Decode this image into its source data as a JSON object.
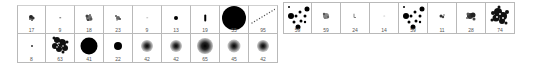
{
  "brush_grid": {
    "row1": [
      {
        "size": "17",
        "type": "scatter"
      },
      {
        "size": "9",
        "type": "dot-small"
      },
      {
        "size": "18",
        "type": "scatter"
      },
      {
        "size": "23",
        "type": "scatter"
      },
      {
        "size": "9",
        "type": "dot-small"
      },
      {
        "size": "13",
        "type": "dot-hard"
      },
      {
        "size": "19",
        "type": "bar-vertical"
      },
      {
        "size": "55",
        "type": "dot-hard-large"
      },
      {
        "size": "95",
        "type": "dotted-line"
      }
    ],
    "row2": [
      {
        "size": "8",
        "type": "dot-small"
      },
      {
        "size": "63",
        "type": "scatter-large"
      },
      {
        "size": "41",
        "type": "dot-hard-large"
      },
      {
        "size": "22",
        "type": "dot-hard"
      },
      {
        "size": "42",
        "type": "soft-round"
      },
      {
        "size": "42",
        "type": "soft-round"
      },
      {
        "size": "65",
        "type": "soft-round"
      },
      {
        "size": "45",
        "type": "soft-round"
      },
      {
        "size": "42",
        "type": "soft-round"
      }
    ]
  },
  "brush_strip": [
    {
      "size": "59",
      "type": "dot-cluster"
    },
    {
      "size": "59",
      "type": "scatter"
    },
    {
      "size": "24",
      "type": "glyph"
    },
    {
      "size": "14",
      "type": "dot-faint"
    },
    {
      "size": "59",
      "type": "dot-cluster"
    },
    {
      "size": "11",
      "type": "scatter"
    },
    {
      "size": "28",
      "type": "scatter"
    },
    {
      "size": "74",
      "type": "scatter-large"
    }
  ]
}
